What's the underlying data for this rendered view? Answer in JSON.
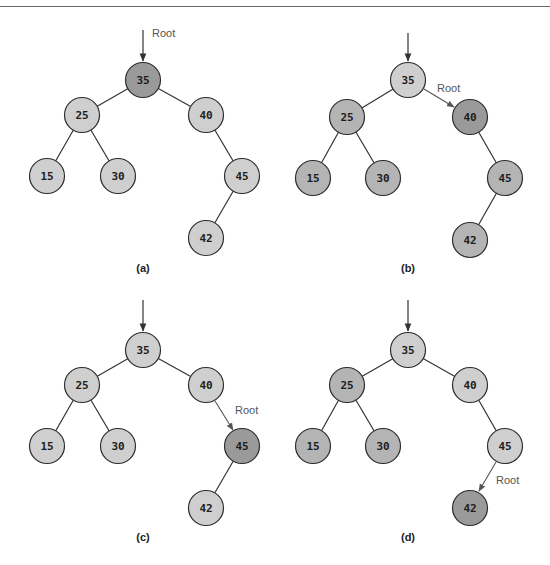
{
  "figure": {
    "colors": {
      "light_node": "#cfcfcf",
      "medium_node": "#b4b4b4",
      "dark_node": "#9a9a9a",
      "edge": "#333333",
      "root_label": "#555555"
    },
    "panels": [
      {
        "id": "a",
        "caption": "(a)",
        "root_label": "Root",
        "current_root": "35",
        "nodes": [
          {
            "value": "35",
            "x": 143,
            "y": 80,
            "shade": "dark"
          },
          {
            "value": "25",
            "x": 82,
            "y": 115,
            "shade": "light"
          },
          {
            "value": "40",
            "x": 206,
            "y": 115,
            "shade": "light"
          },
          {
            "value": "15",
            "x": 47,
            "y": 176,
            "shade": "light"
          },
          {
            "value": "30",
            "x": 118,
            "y": 176,
            "shade": "light"
          },
          {
            "value": "45",
            "x": 242,
            "y": 176,
            "shade": "light"
          },
          {
            "value": "42",
            "x": 206,
            "y": 238,
            "shade": "light"
          }
        ]
      },
      {
        "id": "b",
        "caption": "(b)",
        "root_label": "Root",
        "current_root": "40",
        "nodes": [
          {
            "value": "35",
            "x": 408,
            "y": 80,
            "shade": "light"
          },
          {
            "value": "25",
            "x": 347,
            "y": 117,
            "shade": "medium"
          },
          {
            "value": "40",
            "x": 470,
            "y": 117,
            "shade": "dark"
          },
          {
            "value": "15",
            "x": 313,
            "y": 178,
            "shade": "medium"
          },
          {
            "value": "30",
            "x": 383,
            "y": 178,
            "shade": "medium"
          },
          {
            "value": "45",
            "x": 505,
            "y": 178,
            "shade": "medium"
          },
          {
            "value": "42",
            "x": 470,
            "y": 240,
            "shade": "medium"
          }
        ]
      },
      {
        "id": "c",
        "caption": "(c)",
        "root_label": "Root",
        "current_root": "45",
        "nodes": [
          {
            "value": "35",
            "x": 143,
            "y": 350,
            "shade": "light"
          },
          {
            "value": "25",
            "x": 82,
            "y": 385,
            "shade": "light"
          },
          {
            "value": "40",
            "x": 206,
            "y": 385,
            "shade": "light"
          },
          {
            "value": "15",
            "x": 47,
            "y": 446,
            "shade": "light"
          },
          {
            "value": "30",
            "x": 118,
            "y": 446,
            "shade": "light"
          },
          {
            "value": "45",
            "x": 242,
            "y": 446,
            "shade": "dark"
          },
          {
            "value": "42",
            "x": 206,
            "y": 508,
            "shade": "light"
          }
        ]
      },
      {
        "id": "d",
        "caption": "(d)",
        "root_label": "Root",
        "current_root": "42",
        "nodes": [
          {
            "value": "35",
            "x": 408,
            "y": 350,
            "shade": "light"
          },
          {
            "value": "25",
            "x": 347,
            "y": 385,
            "shade": "medium"
          },
          {
            "value": "40",
            "x": 470,
            "y": 385,
            "shade": "light"
          },
          {
            "value": "15",
            "x": 313,
            "y": 446,
            "shade": "medium"
          },
          {
            "value": "30",
            "x": 383,
            "y": 446,
            "shade": "medium"
          },
          {
            "value": "45",
            "x": 505,
            "y": 446,
            "shade": "light"
          },
          {
            "value": "42",
            "x": 470,
            "y": 508,
            "shade": "dark"
          }
        ]
      }
    ]
  }
}
